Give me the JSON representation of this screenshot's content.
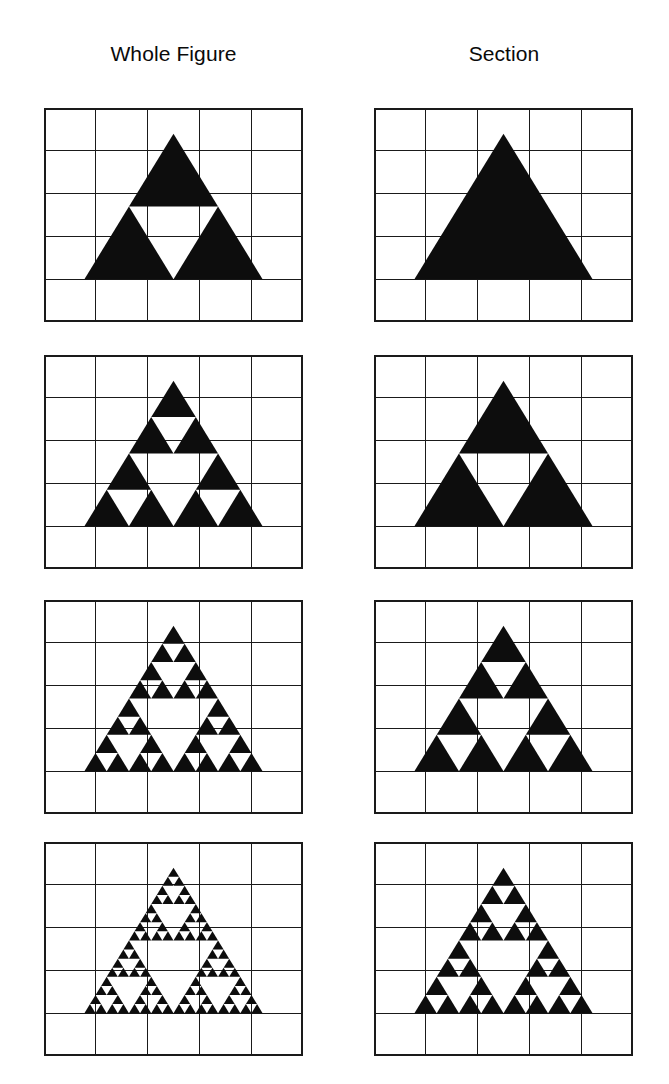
{
  "figure": {
    "background_color": "#ffffff",
    "ink_color": "#0d0d0d",
    "grid_color": "#1a1a1a"
  },
  "columns": [
    {
      "key": "whole",
      "label": "Whole Figure"
    },
    {
      "key": "section",
      "label": "Section"
    }
  ],
  "grid": {
    "cols": 5,
    "rows": 5,
    "cell_width": 51.8,
    "cell_height": 42.8
  },
  "panel_geometry": {
    "left_column_x": 44,
    "right_column_x": 374,
    "panel_width": 259,
    "panel_height": 214,
    "row_tops": [
      108,
      355,
      600,
      842
    ],
    "row_gap": 33
  },
  "triangle_placement": {
    "apex_col": 2.5,
    "apex_row": 0.6,
    "base_row": 4.0,
    "half_width_cells": 1.72,
    "note": "apex near top of second grid row, base resting on gridline one cell above panel bottom"
  },
  "chart_data": {
    "type": "diagram",
    "subtype": "sierpinski-triangle-iteration-grid",
    "columns": [
      "Whole Figure",
      "Section"
    ],
    "rows": [
      {
        "row_index": 1,
        "whole_figure_depth": 1,
        "section_depth": 0,
        "whole_figure_triangle_count": 3,
        "section_triangle_count": 1
      },
      {
        "row_index": 2,
        "whole_figure_depth": 2,
        "section_depth": 1,
        "whole_figure_triangle_count": 9,
        "section_triangle_count": 3
      },
      {
        "row_index": 3,
        "whole_figure_depth": 3,
        "section_depth": 2,
        "whole_figure_triangle_count": 27,
        "section_triangle_count": 9
      },
      {
        "row_index": 4,
        "whole_figure_depth": 4,
        "section_depth": 3,
        "whole_figure_triangle_count": 81,
        "section_triangle_count": 27
      }
    ],
    "legend": [],
    "annotations": [],
    "grid": true
  },
  "panels": [
    {
      "id": "panel-r1-whole",
      "row": 1,
      "column": "whole",
      "depth": 1
    },
    {
      "id": "panel-r1-section",
      "row": 1,
      "column": "section",
      "depth": 0
    },
    {
      "id": "panel-r2-whole",
      "row": 2,
      "column": "whole",
      "depth": 2
    },
    {
      "id": "panel-r2-section",
      "row": 2,
      "column": "section",
      "depth": 1
    },
    {
      "id": "panel-r3-whole",
      "row": 3,
      "column": "whole",
      "depth": 3
    },
    {
      "id": "panel-r3-section",
      "row": 3,
      "column": "section",
      "depth": 2
    },
    {
      "id": "panel-r4-whole",
      "row": 4,
      "column": "whole",
      "depth": 4
    },
    {
      "id": "panel-r4-section",
      "row": 4,
      "column": "section",
      "depth": 3
    }
  ]
}
